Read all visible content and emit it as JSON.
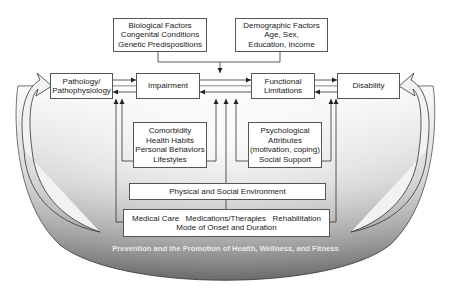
{
  "diagram": {
    "type": "flow-model",
    "top_factors": [
      {
        "lines": [
          "Biological Factors",
          "Congenital Conditions",
          "Genetic Predispositions"
        ]
      },
      {
        "lines": [
          "Demographic Factors",
          "Age, Sex,",
          "Education, Income"
        ]
      }
    ],
    "main_chain": [
      {
        "lines": [
          "Pathology/",
          "Pathophysiology"
        ]
      },
      {
        "lines": [
          "Impairment"
        ]
      },
      {
        "lines": [
          "Functional",
          "Limitations"
        ]
      },
      {
        "lines": [
          "Disability"
        ]
      }
    ],
    "modifiers": [
      {
        "lines": [
          "Comorbidity",
          "Health Habits",
          "Personal Behaviors",
          "Lifestyles"
        ]
      },
      {
        "lines": [
          "Psychological",
          "Attributes",
          "(motivation, coping)",
          "Social Support"
        ]
      }
    ],
    "environment": {
      "label": "Physical and Social Environment"
    },
    "care": {
      "items": [
        "Medical Care",
        "Medications/Therapies",
        "Rehabilitation"
      ],
      "subtitle": "Mode of Onset and Duration"
    },
    "footer": "Prevention and the Promotion of Health, Wellness, and Fitness",
    "colors": {
      "bowl_light": "#f4f4f4",
      "bowl_dark": "#6e6e6e",
      "line": "#333333",
      "box_fill": "#ffffff"
    }
  }
}
